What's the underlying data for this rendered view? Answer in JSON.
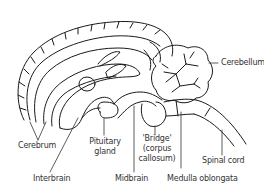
{
  "diagram": {
    "labels": {
      "cerebellum": "Cerebellum",
      "cerebrum": "Cerebrum",
      "pituitary_line1": "Pituitary",
      "pituitary_line2": "gland",
      "bridge_line1": "'Bridge'",
      "bridge_line2": "(corpus",
      "bridge_line3": "callosum)",
      "spinal_cord": "Spinal cord",
      "interbrain": "Interbrain",
      "midbrain": "Midbrain",
      "medulla": "Medulla oblongata"
    },
    "colors": {
      "stroke": "#1a1a1a",
      "text": "#333333",
      "background": "#ffffff"
    }
  }
}
